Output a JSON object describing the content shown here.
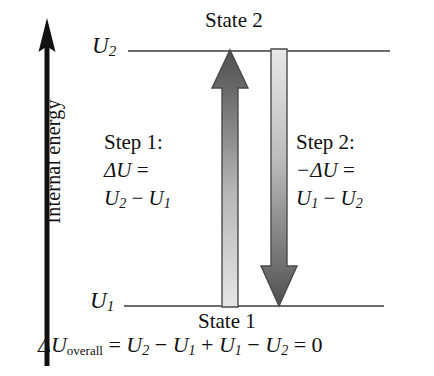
{
  "figure": {
    "type": "energy-level-diagram",
    "background_color": "#ffffff",
    "ink_color": "#111111"
  },
  "axis": {
    "label": "Internal energy",
    "direction": "up",
    "icon": "up-arrow-icon"
  },
  "levels": [
    {
      "id": "u2",
      "tag": "U",
      "tag_sub": "2",
      "state_caption": "State 2",
      "position": "upper",
      "line_color": "#6c6c6c"
    },
    {
      "id": "u1",
      "tag": "U",
      "tag_sub": "1",
      "state_caption": "State 1",
      "position": "lower",
      "line_color": "#6c6c6c"
    }
  ],
  "steps": [
    {
      "id": "step1",
      "title": "Step 1:",
      "line2_lead": "ΔU",
      "line2_op": " = ",
      "line3": "U",
      "line3_sub_a": "2",
      "line3_op": " − ",
      "line3_b": "U",
      "line3_sub_b": "1",
      "arrow": {
        "name": "step1-up-arrow",
        "direction": "up",
        "from_level": "u1",
        "to_level": "u2",
        "gradient_top": "#555555",
        "gradient_bottom": "#e2e2e2"
      }
    },
    {
      "id": "step2",
      "title": "Step 2:",
      "line2_lead": "−ΔU",
      "line2_op": " = ",
      "line3": "U",
      "line3_sub_a": "1",
      "line3_op": " − ",
      "line3_b": "U",
      "line3_sub_b": "2",
      "arrow": {
        "name": "step2-down-arrow",
        "direction": "down",
        "from_level": "u2",
        "to_level": "u1",
        "gradient_top": "#e2e2e2",
        "gradient_bottom": "#555555"
      }
    }
  ],
  "overall": {
    "lead": "ΔU",
    "sub_word": "overall",
    "eq1": " = ",
    "t1": "U",
    "t1_sub": "2",
    "op1": " − ",
    "t2": "U",
    "t2_sub": "1",
    "op2": " + ",
    "t3": "U",
    "t3_sub": "1",
    "op3": " − ",
    "t4": "U",
    "t4_sub": "2",
    "eq2": " = ",
    "result": "0"
  }
}
